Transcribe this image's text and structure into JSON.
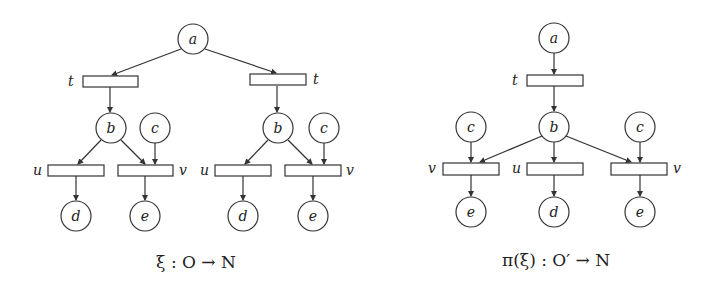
{
  "figure": {
    "left": {
      "caption": "ξ : O → N",
      "places": [
        {
          "id": "a",
          "label": "a",
          "cx": 193,
          "cy": 39
        },
        {
          "id": "b1",
          "label": "b",
          "cx": 111,
          "cy": 128
        },
        {
          "id": "c1",
          "label": "c",
          "cx": 155,
          "cy": 128
        },
        {
          "id": "b2",
          "label": "b",
          "cx": 278,
          "cy": 128
        },
        {
          "id": "c2",
          "label": "c",
          "cx": 324,
          "cy": 128
        },
        {
          "id": "d1",
          "label": "d",
          "cx": 76,
          "cy": 216
        },
        {
          "id": "e1",
          "label": "e",
          "cx": 145,
          "cy": 216
        },
        {
          "id": "d2",
          "label": "d",
          "cx": 243,
          "cy": 216
        },
        {
          "id": "e2",
          "label": "e",
          "cx": 313,
          "cy": 216
        }
      ],
      "transitions": [
        {
          "id": "t1",
          "label": "t",
          "x": 83,
          "y": 76,
          "label_side": "left"
        },
        {
          "id": "t2",
          "label": "t",
          "x": 250,
          "y": 74,
          "label_side": "right"
        },
        {
          "id": "u1",
          "label": "u",
          "x": 48,
          "y": 165,
          "label_side": "left"
        },
        {
          "id": "v1",
          "label": "v",
          "x": 118,
          "y": 165,
          "label_side": "right"
        },
        {
          "id": "u2",
          "label": "u",
          "x": 215,
          "y": 165,
          "label_side": "left"
        },
        {
          "id": "v2",
          "label": "v",
          "x": 285,
          "y": 165,
          "label_side": "right"
        }
      ]
    },
    "right": {
      "caption": "π(ξ) : O′ → N",
      "places": [
        {
          "id": "a",
          "label": "a",
          "cx": 554,
          "cy": 38
        },
        {
          "id": "c1",
          "label": "c",
          "cx": 471,
          "cy": 127
        },
        {
          "id": "b",
          "label": "b",
          "cx": 554,
          "cy": 127
        },
        {
          "id": "c2",
          "label": "c",
          "cx": 640,
          "cy": 127
        },
        {
          "id": "e1",
          "label": "e",
          "cx": 471,
          "cy": 212
        },
        {
          "id": "d",
          "label": "d",
          "cx": 554,
          "cy": 212
        },
        {
          "id": "e2",
          "label": "e",
          "cx": 640,
          "cy": 212
        }
      ],
      "transitions": [
        {
          "id": "t",
          "label": "t",
          "x": 527,
          "y": 75,
          "label_side": "left"
        },
        {
          "id": "v1",
          "label": "v",
          "x": 443,
          "y": 163,
          "label_side": "left"
        },
        {
          "id": "u",
          "label": "u",
          "x": 527,
          "y": 163,
          "label_side": "left"
        },
        {
          "id": "v2",
          "label": "v",
          "x": 611,
          "y": 163,
          "label_side": "right"
        }
      ]
    }
  }
}
